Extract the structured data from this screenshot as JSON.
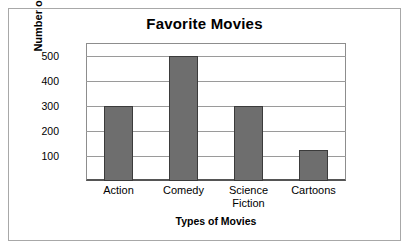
{
  "chart_data": {
    "type": "bar",
    "title": "Favorite Movies",
    "xlabel": "Types of Movies",
    "ylabel": "Number of Votes",
    "categories": [
      "Action",
      "Comedy",
      "Science Fiction",
      "Cartoons"
    ],
    "values": [
      300,
      500,
      300,
      125
    ],
    "ylim": [
      0,
      550
    ],
    "yticks": [
      100,
      200,
      300,
      400,
      500
    ],
    "ytick_labels": [
      "100",
      "200",
      "300",
      "400",
      "500"
    ],
    "grid": true,
    "legend": null,
    "bar_color": "#6e6e6e",
    "bar_edge_color": "#3b3b3b",
    "axis_color": "#8d8d8d",
    "grid_color": "#9a9a9a",
    "background": "#ffffff"
  },
  "category_lines": [
    [
      "Action"
    ],
    [
      "Comedy"
    ],
    [
      "Science",
      "Fiction"
    ],
    [
      "Cartoons"
    ]
  ]
}
